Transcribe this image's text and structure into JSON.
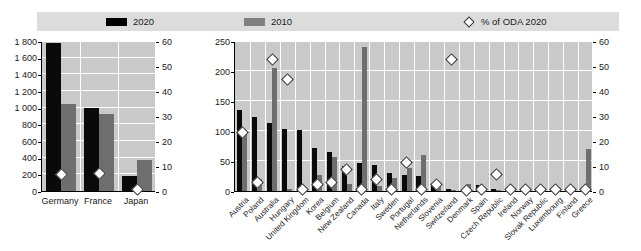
{
  "legend": {
    "items": [
      {
        "label": "2020",
        "marker": "black-square-swatch",
        "color": "#000000"
      },
      {
        "label": "2010",
        "marker": "gray-square-swatch",
        "color": "#808080"
      },
      {
        "label": "% of ODA 2020",
        "marker": "diamond-outline-marker",
        "color": "#ffffff"
      }
    ]
  },
  "chart_data": [
    {
      "id": "left-panel",
      "type": "bar",
      "title": "",
      "xlabel": "",
      "ylabel": "",
      "categories": [
        "Germany",
        "France",
        "Japan"
      ],
      "series": [
        {
          "name": "2020",
          "axis": "left",
          "values": [
            1780,
            995,
            185
          ]
        },
        {
          "name": "2010",
          "axis": "left",
          "values": [
            1040,
            925,
            375
          ]
        },
        {
          "name": "% of ODA 2020",
          "axis": "right",
          "type": "scatter",
          "values": [
            7,
            7.5,
            1
          ]
        }
      ],
      "ylim": [
        0,
        1800
      ],
      "yticks": [
        "0",
        "200",
        "400",
        "600",
        "800",
        "1 000",
        "1 200",
        "1 400",
        "1 600",
        "1 800"
      ],
      "ylim_right": [
        0,
        60
      ],
      "yticks_right": [
        "0",
        "10",
        "20",
        "30",
        "40",
        "50",
        "60"
      ],
      "grid": true,
      "legend_position": "top"
    },
    {
      "id": "right-panel",
      "type": "bar",
      "title": "",
      "xlabel": "",
      "ylabel": "",
      "categories": [
        "Austria",
        "Poland",
        "Australia",
        "Hungary",
        "United Kingdom",
        "Korea",
        "Belgium",
        "New Zealand",
        "Canada",
        "Italy",
        "Sweden",
        "Portugal",
        "Netherlands",
        "Slovenia",
        "Switzerland",
        "Denmark",
        "Spain",
        "Czech Republic",
        "Ireland",
        "Norway",
        "Slovak Republic",
        "Luxembourg",
        "Finland",
        "Greece"
      ],
      "series": [
        {
          "name": "2020",
          "axis": "left",
          "values": [
            135,
            124,
            113,
            103,
            101,
            72,
            65,
            41,
            46,
            44,
            30,
            26,
            25,
            13,
            3,
            4,
            10,
            3,
            2,
            2,
            1,
            1,
            1,
            2
          ]
        },
        {
          "name": "2010",
          "axis": "left",
          "values": [
            101,
            20,
            205,
            4,
            5,
            26,
            57,
            12,
            240,
            8,
            22,
            38,
            60,
            6,
            1,
            11,
            3,
            2,
            1,
            1,
            1,
            1,
            1,
            70
          ]
        },
        {
          "name": "% of ODA 2020",
          "axis": "right",
          "type": "scatter",
          "values": [
            24,
            4,
            53,
            45,
            1,
            3,
            4,
            9,
            1,
            5,
            1,
            12,
            1,
            3,
            53,
            0.5,
            1,
            7,
            1,
            1,
            1,
            1,
            1,
            1
          ]
        }
      ],
      "ylim": [
        0,
        250
      ],
      "yticks": [
        "0",
        "50",
        "100",
        "150",
        "200",
        "250"
      ],
      "ylim_right": [
        0,
        60
      ],
      "yticks_right": [
        "0",
        "10",
        "20",
        "30",
        "40",
        "50",
        "60"
      ],
      "grid": true,
      "legend_position": "top"
    }
  ]
}
